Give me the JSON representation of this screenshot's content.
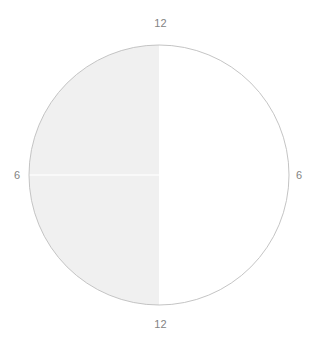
{
  "chart_data": {
    "type": "pie",
    "title": "",
    "subtitle": "",
    "xlabel": "",
    "ylabel": "",
    "grid": false,
    "legend": "none",
    "categories": [
      "left",
      "right"
    ],
    "values": [
      50,
      50
    ],
    "slices": [
      {
        "name": "left-half",
        "value": 50,
        "start_angle": 180,
        "end_angle": 360,
        "fill": "#f0f0f0"
      },
      {
        "name": "right-half",
        "value": 50,
        "start_angle": 0,
        "end_angle": 180,
        "fill": "#ffffff"
      }
    ],
    "annotations": [
      {
        "name": "top",
        "text": "12",
        "position": "top"
      },
      {
        "name": "bottom",
        "text": "12",
        "position": "bottom"
      },
      {
        "name": "left",
        "text": "6",
        "position": "left"
      },
      {
        "name": "right",
        "text": "6",
        "position": "right"
      }
    ],
    "tick_labels": [
      "12",
      "6",
      "12",
      "6"
    ]
  },
  "labels": {
    "top": "12",
    "bottom": "12",
    "left": "6",
    "right": "6"
  },
  "colors": {
    "fill_left": "#f0f0f0",
    "fill_right": "#ffffff",
    "outline": "#bdbdbd",
    "radius_line": "#fcfcfc",
    "label_text": "#838383",
    "background": "#ffffff"
  },
  "geometry": {
    "center_x": 159,
    "center_y": 175,
    "radius": 130
  }
}
